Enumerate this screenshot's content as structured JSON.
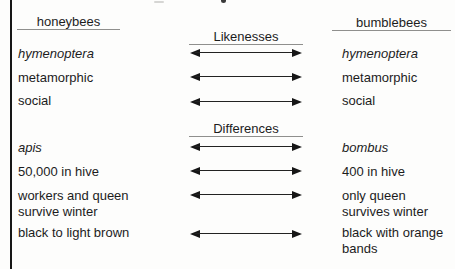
{
  "headers": {
    "left": "honeybees",
    "right": "bumblebees"
  },
  "sections": [
    {
      "label": "Likenesses",
      "rows": [
        {
          "left": "hymenoptera",
          "right": "hymenoptera"
        },
        {
          "left": "metamorphic",
          "right": "metamorphic"
        },
        {
          "left": "social",
          "right": "social"
        }
      ]
    },
    {
      "label": "Differences",
      "rows": [
        {
          "left": "apis",
          "right": "bombus"
        },
        {
          "left": "50,000 in hive",
          "right": "400 in hive"
        },
        {
          "left": "workers and queen survive winter",
          "right": "only queen survives winter"
        },
        {
          "left": "black to light brown",
          "right": "black with orange bands"
        }
      ]
    }
  ],
  "colors": {
    "background": "#fdfdfc",
    "text": "#1c1c1c",
    "arrow": "#161616",
    "underline": "#8f8f8d"
  }
}
